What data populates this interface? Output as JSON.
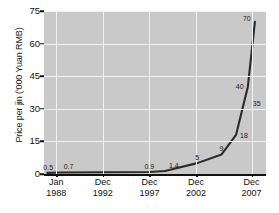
{
  "chart_data": {
    "type": "line",
    "title": "",
    "xlabel": "",
    "ylabel": "Price per jin ('000 Yuan RMB)",
    "ylim": [
      0,
      75
    ],
    "yticks": [
      0,
      15,
      30,
      45,
      60,
      75
    ],
    "ytick_labels": [
      "0",
      "15",
      "30",
      "45",
      "60",
      "75"
    ],
    "grid": true,
    "legend": "none",
    "x_tick_labels": [
      {
        "month": "Jan",
        "year": "1988"
      },
      {
        "month": "Dec",
        "year": "1992"
      },
      {
        "month": "Dec",
        "year": "1997"
      },
      {
        "month": "Dec",
        "year": "2002"
      },
      {
        "month": "Dec",
        "year": "2007"
      }
    ],
    "x_tick_positions": [
      0.055,
      0.265,
      0.475,
      0.685,
      0.935
    ],
    "series": [
      {
        "name": "Price per jin",
        "points": [
          {
            "label": "0.5",
            "x": 0.015,
            "y": 0.5
          },
          {
            "label": "0.7",
            "x": 0.075,
            "y": 0.7
          },
          {
            "label": "0.9",
            "x": 0.475,
            "y": 0.9
          },
          {
            "label": "1.4",
            "x": 0.545,
            "y": 1.4
          },
          {
            "label": "5",
            "x": 0.69,
            "y": 5
          },
          {
            "label": "9",
            "x": 0.8,
            "y": 9
          },
          {
            "label": "18",
            "x": 0.865,
            "y": 18
          },
          {
            "label": "40",
            "x": 0.918,
            "y": 40
          },
          {
            "label": "35",
            "x": 0.918,
            "y": 35
          },
          {
            "label": "70",
            "x": 0.95,
            "y": 70
          }
        ]
      }
    ],
    "values": [
      0.5,
      0.7,
      0.9,
      1.4,
      5,
      9,
      18,
      40,
      35,
      70
    ],
    "colors": {
      "plot_background": "#c9c9c9",
      "gridline": "#f2f2f2",
      "line": "#2b2b2b",
      "axis": "#111111",
      "text": "#111111",
      "page_background": "#ffffff"
    }
  }
}
